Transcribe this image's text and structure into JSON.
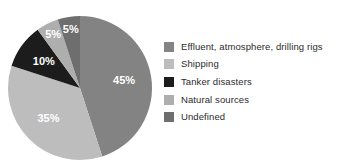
{
  "chart_data": {
    "type": "pie",
    "title": "",
    "subtitle": "",
    "xlabel": "",
    "ylabel": "",
    "grid": false,
    "legend_position": "right",
    "background_color": "#ffffff",
    "start_angle_deg": 0,
    "direction": "clockwise",
    "categories": [
      "Effluent, atmosphere, drilling rigs",
      "Shipping",
      "Tanker disasters",
      "Natural sources",
      "Undefined"
    ],
    "values": [
      45,
      35,
      10,
      5,
      5
    ],
    "value_labels": [
      "45%",
      "35%",
      "10%",
      "5%",
      "5%"
    ],
    "colors": [
      "#838383",
      "#bdbdbd",
      "#1c1c1c",
      "#aeaeae",
      "#6e6e6e"
    ],
    "units": "percent",
    "total": 100
  },
  "legend": {
    "items": [
      {
        "label": "Effluent, atmosphere, drilling rigs",
        "color": "#838383"
      },
      {
        "label": "Shipping",
        "color": "#bdbdbd"
      },
      {
        "label": "Tanker disasters",
        "color": "#1c1c1c"
      },
      {
        "label": "Natural sources",
        "color": "#aeaeae"
      },
      {
        "label": "Undefined",
        "color": "#6e6e6e"
      }
    ]
  },
  "pie_labels": {
    "slice_0": "45%",
    "slice_1": "35%",
    "slice_2": "10%",
    "slice_3": "5%",
    "slice_4": "5%"
  }
}
